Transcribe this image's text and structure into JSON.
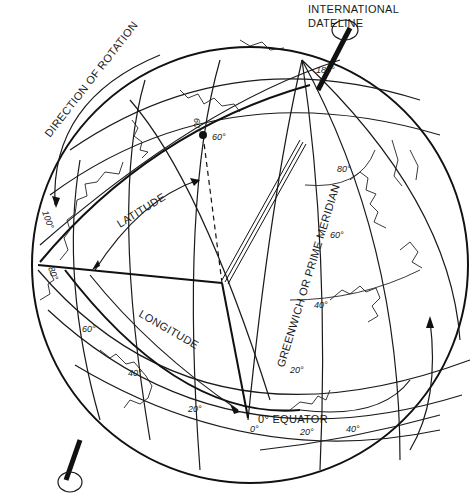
{
  "labels": {
    "international_dateline_1": "INTERNATIONAL",
    "international_dateline_2": "DATELINE",
    "direction_of_rotation": "DIRECTION OF ROTATION",
    "latitude": "LATITUDE",
    "longitude": "LONGITUDE",
    "prime_meridian": "GREENWICH OR PRIME MERIDIAN",
    "equator": "0° EQUATOR"
  },
  "degree_marks": {
    "dateline": "180°",
    "lat_60_vertical": "60°",
    "lat_60_horizontal": "60°",
    "meridian_80": "80°",
    "meridian_60": "60°",
    "meridian_40": "40°",
    "meridian_20": "20°",
    "left_100": "100°",
    "left_80": "80°",
    "lower_60": "60°",
    "lower_40": "40°",
    "lower_20": "20°",
    "equator_0": "0°",
    "equator_20": "20°",
    "equator_40": "40°"
  },
  "colors": {
    "ink": "#1a1a1a",
    "background": "#ffffff"
  }
}
